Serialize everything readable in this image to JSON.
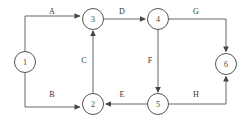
{
  "diagram": {
    "type": "directed-graph",
    "canvas": {
      "width": 252,
      "height": 122,
      "background": "#ffffff"
    },
    "style": {
      "node_stroke": "#555555",
      "node_fill": "#ffffff",
      "edge_stroke": "#666666",
      "label_color": "#333333",
      "node_radius": 10.5
    },
    "nodes": [
      {
        "id": "1",
        "label": "1",
        "cx": 25,
        "cy": 62,
        "r": 10.5
      },
      {
        "id": "2",
        "label": "2",
        "cx": 93,
        "cy": 104,
        "r": 10.5
      },
      {
        "id": "3",
        "label": "3",
        "cx": 93,
        "cy": 19,
        "r": 10.5
      },
      {
        "id": "4",
        "label": "4",
        "cx": 158,
        "cy": 19,
        "r": 10.5
      },
      {
        "id": "5",
        "label": "5",
        "cx": 158,
        "cy": 104,
        "r": 10.5
      },
      {
        "id": "6",
        "label": "6",
        "cx": 226,
        "cy": 64,
        "r": 10.5
      }
    ],
    "edges": [
      {
        "id": "edge-a",
        "label": "A",
        "from": "1",
        "to": "3",
        "label_x": 52,
        "label_y": 11,
        "path": "M 25,51.5 L 25,16 L 80,16",
        "arrow_x": 80.5,
        "arrow_y": 16,
        "arrow_dir": "right"
      },
      {
        "id": "edge-b",
        "label": "B",
        "from": "1",
        "to": "2",
        "label_x": 52,
        "label_y": 94,
        "path": "M 25,72.5 L 25,107 L 80,107",
        "arrow_x": 80.5,
        "arrow_y": 107,
        "arrow_dir": "right"
      },
      {
        "id": "edge-c",
        "label": "C",
        "from": "2",
        "to": "3",
        "label_x": 84,
        "label_y": 60,
        "path": "M 93,93.5 L 93,31",
        "arrow_x": 93,
        "arrow_y": 30.5,
        "arrow_dir": "up"
      },
      {
        "id": "edge-d",
        "label": "D",
        "from": "3",
        "to": "4",
        "label_x": 122,
        "label_y": 11,
        "path": "M 103.5,19 L 145,19",
        "arrow_x": 145.5,
        "arrow_y": 19,
        "arrow_dir": "right"
      },
      {
        "id": "edge-e",
        "label": "E",
        "from": "5",
        "to": "2",
        "label_x": 122,
        "label_y": 94,
        "path": "M 147.5,104 L 106,104",
        "arrow_x": 105.5,
        "arrow_y": 104,
        "arrow_dir": "left"
      },
      {
        "id": "edge-f",
        "label": "F",
        "from": "4",
        "to": "5",
        "label_x": 150,
        "label_y": 60,
        "path": "M 158,29.5 L 158,92",
        "arrow_x": 158,
        "arrow_y": 92.5,
        "arrow_dir": "down"
      },
      {
        "id": "edge-g",
        "label": "G",
        "from": "4",
        "to": "6",
        "label_x": 196,
        "label_y": 11,
        "path": "M 168.5,19 L 226,19 L 226,51",
        "arrow_x": 226,
        "arrow_y": 51.5,
        "arrow_dir": "down"
      },
      {
        "id": "edge-h",
        "label": "H",
        "from": "5",
        "to": "6",
        "label_x": 196,
        "label_y": 94,
        "path": "M 168.5,104 L 226,104 L 226,77",
        "arrow_x": 226,
        "arrow_y": 76.5,
        "arrow_dir": "up"
      }
    ]
  }
}
